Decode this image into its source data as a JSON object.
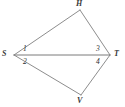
{
  "figure": {
    "kind": "geometry-diagram",
    "shape": "quadrilateral with one diagonal",
    "stroke_color": "#8d8d8d",
    "diagonal_color": "#7a7a7a",
    "label_color": "#3a3a3a",
    "background_color": "#ffffff",
    "width": 125,
    "height": 107
  },
  "vertices": [
    {
      "id": "S",
      "label": "S",
      "x": 14,
      "y": 55,
      "label_x": 2,
      "label_y": 51
    },
    {
      "id": "H",
      "label": "H",
      "x": 80,
      "y": 10,
      "label_x": 76,
      "label_y": 1
    },
    {
      "id": "T",
      "label": "T",
      "x": 110,
      "y": 55,
      "label_x": 114,
      "label_y": 51
    },
    {
      "id": "V",
      "label": "V",
      "x": 81,
      "y": 95,
      "label_x": 77,
      "label_y": 97
    }
  ],
  "edges": [
    {
      "id": "SH",
      "from": "S",
      "to": "H",
      "type": "side"
    },
    {
      "id": "HT",
      "from": "H",
      "to": "T",
      "type": "side"
    },
    {
      "id": "TV",
      "from": "T",
      "to": "V",
      "type": "side"
    },
    {
      "id": "VS",
      "from": "V",
      "to": "S",
      "type": "side"
    },
    {
      "id": "ST",
      "from": "S",
      "to": "T",
      "type": "diagonal"
    }
  ],
  "angle_labels": [
    {
      "id": "angle-1",
      "text": "1",
      "x": 23,
      "y": 45,
      "at_vertex": "S",
      "position": "above-diagonal"
    },
    {
      "id": "angle-2",
      "text": "2",
      "x": 23,
      "y": 58,
      "at_vertex": "S",
      "position": "below-diagonal"
    },
    {
      "id": "angle-3",
      "text": "3",
      "x": 96,
      "y": 45,
      "at_vertex": "T",
      "position": "above-diagonal"
    },
    {
      "id": "angle-4",
      "text": "4",
      "x": 96,
      "y": 58,
      "at_vertex": "T",
      "position": "below-diagonal"
    }
  ]
}
